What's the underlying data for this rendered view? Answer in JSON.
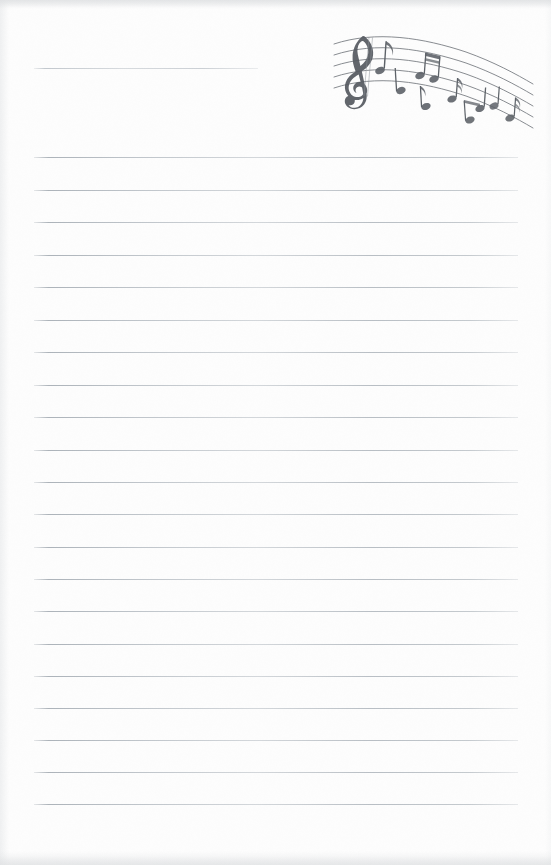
{
  "page": {
    "kind": "scanned-lined-notepaper",
    "width": 551,
    "height": 865,
    "paper_color": "#fdfdfd",
    "rule_color": "#b0b7be",
    "ink_color": "#5a5f66"
  },
  "ruled_lines": {
    "left": 34,
    "right": 518,
    "spacing": 32.5,
    "first_line": {
      "y": 68,
      "left": 34,
      "right": 258,
      "short": true,
      "note": "shortened to clear the music artwork"
    },
    "lines_y": [
      68,
      157,
      190,
      222,
      255,
      287,
      320,
      352,
      385,
      417,
      450,
      482,
      514,
      547,
      579,
      611,
      644,
      676,
      708,
      740,
      772,
      804
    ],
    "count": 22
  },
  "artwork": {
    "name": "music-staff-graphic",
    "description": "wavy five-line musical staff with treble clef and eighth notes",
    "x": 328,
    "y": 24,
    "width": 210,
    "height": 112,
    "staff_lines": 5,
    "clef": "treble-clef",
    "notes": [
      {
        "name": "eighth-note-1",
        "type": "eighth",
        "stem": "up",
        "flag": true
      },
      {
        "name": "eighth-note-2",
        "type": "eighth",
        "stem": "up",
        "flag": true
      },
      {
        "name": "beamed-pair-1",
        "type": "beamed-eighths",
        "stem": "up",
        "count": 2
      },
      {
        "name": "eighth-note-3",
        "type": "eighth",
        "stem": "down",
        "flag": true
      },
      {
        "name": "eighth-note-4",
        "type": "eighth",
        "stem": "up",
        "flag": true
      },
      {
        "name": "eighth-note-5",
        "type": "eighth",
        "stem": "down",
        "flag": true
      },
      {
        "name": "beamed-pair-2",
        "type": "beamed-eighths",
        "stem": "down",
        "count": 2
      },
      {
        "name": "eighth-note-6",
        "type": "eighth",
        "stem": "down",
        "flag": true
      },
      {
        "name": "eighth-note-7",
        "type": "eighth",
        "stem": "up",
        "flag": true
      }
    ]
  }
}
